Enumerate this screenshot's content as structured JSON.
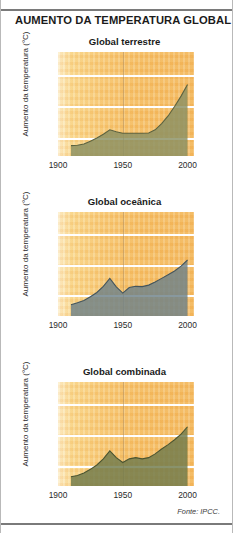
{
  "figure": {
    "title": "AUMENTO DA TEMPERATURA GLOBAL",
    "source": "Fonte: IPCC."
  },
  "axis": {
    "ylabel": "Aumento da temperatura (°C)",
    "yticks": [
      "32",
      "33",
      "34"
    ],
    "xticks": [
      "1900",
      "1950",
      "2000"
    ]
  },
  "colors": {
    "land_fill": "#8a9063",
    "land_line": "#5d6340",
    "ocean_fill": "#6e8189",
    "ocean_line": "#44555d",
    "combined_fill": "#6f7a4c",
    "combined_line": "#4c5531",
    "background_start": "#fdf0cf",
    "background_end": "#f3b95f",
    "gridline": "#ffffff",
    "rule": "#7a7a7a"
  },
  "chart_data": [
    {
      "type": "area",
      "title": "Global terrestre",
      "xlabel": "",
      "ylabel": "Aumento da temperatura (°C)",
      "xlim": [
        1900,
        2005
      ],
      "ylim": [
        31.45,
        34.75
      ],
      "categories": [
        "1900",
        "1950",
        "2000"
      ],
      "grid": true,
      "legend": "none",
      "x": [
        1910,
        1915,
        1920,
        1925,
        1930,
        1935,
        1940,
        1945,
        1950,
        1955,
        1960,
        1965,
        1970,
        1975,
        1980,
        1985,
        1990,
        1995,
        2000
      ],
      "values": [
        31.78,
        31.79,
        31.83,
        31.92,
        32.02,
        32.14,
        32.28,
        32.22,
        32.17,
        32.17,
        32.17,
        32.17,
        32.18,
        32.28,
        32.48,
        32.72,
        33.02,
        33.35,
        33.72
      ]
    },
    {
      "type": "area",
      "title": "Global oceânica",
      "xlabel": "",
      "ylabel": "Aumento da temperatura (°C)",
      "xlim": [
        1900,
        2005
      ],
      "ylim": [
        31.35,
        34.75
      ],
      "categories": [
        "1900",
        "1950",
        "2000"
      ],
      "grid": true,
      "legend": "none",
      "x": [
        1910,
        1915,
        1920,
        1925,
        1930,
        1935,
        1940,
        1945,
        1950,
        1955,
        1960,
        1965,
        1970,
        1975,
        1980,
        1985,
        1990,
        1995,
        2000
      ],
      "values": [
        31.72,
        31.78,
        31.86,
        31.98,
        32.12,
        32.32,
        32.58,
        32.3,
        32.1,
        32.28,
        32.32,
        32.31,
        32.36,
        32.46,
        32.58,
        32.7,
        32.82,
        32.98,
        33.18
      ]
    },
    {
      "type": "area",
      "title": "Global combinada",
      "xlabel": "",
      "ylabel": "Aumento da temperatura (°C)",
      "xlim": [
        1900,
        2005
      ],
      "ylim": [
        31.38,
        34.75
      ],
      "categories": [
        "1900",
        "1950",
        "2000"
      ],
      "grid": true,
      "legend": "none",
      "x": [
        1910,
        1915,
        1920,
        1925,
        1930,
        1935,
        1940,
        1945,
        1950,
        1955,
        1960,
        1965,
        1970,
        1975,
        1980,
        1985,
        1990,
        1995,
        2000
      ],
      "values": [
        31.68,
        31.72,
        31.8,
        31.92,
        32.06,
        32.26,
        32.52,
        32.3,
        32.14,
        32.26,
        32.3,
        32.26,
        32.3,
        32.42,
        32.58,
        32.72,
        32.88,
        33.06,
        33.3
      ]
    }
  ]
}
